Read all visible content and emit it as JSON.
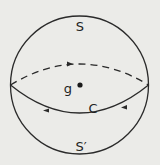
{
  "diagram": {
    "labels": {
      "upper_hemisphere": "S",
      "lower_hemisphere": "S′",
      "center": "g",
      "equator_curve": "C"
    },
    "colors": {
      "background": "#ebebe8",
      "stroke": "#2a2a2a"
    }
  }
}
